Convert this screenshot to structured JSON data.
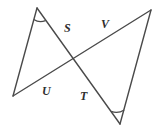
{
  "figure": {
    "canvas": {
      "width": 159,
      "height": 132
    },
    "background_color": "#ffffff",
    "stroke_color": "#4a4a4a",
    "label_color": "#2e2e2e",
    "vertices": {
      "top_left_apex": {
        "x": 37,
        "y": 8
      },
      "left_vertex": {
        "x": 13,
        "y": 96
      },
      "right_apex": {
        "x": 151,
        "y": 10
      },
      "bottom_right_vertex": {
        "x": 120,
        "y": 124
      },
      "crossing_point": {
        "x": 75,
        "y": 60
      }
    },
    "segments": [
      {
        "name": "apex-to-left-vertex",
        "from": "top_left_apex",
        "to": "left_vertex"
      },
      {
        "name": "apex-to-bottom-right-vertex",
        "from": "top_left_apex",
        "to": "bottom_right_vertex"
      },
      {
        "name": "left-vertex-to-right-apex",
        "from": "left_vertex",
        "to": "right_apex"
      },
      {
        "name": "right-apex-to-bottom-right-vertex",
        "from": "right_apex",
        "to": "bottom_right_vertex"
      }
    ],
    "angle_marks": [
      {
        "name": "arc-at-top-left-apex",
        "at": "top_left_apex"
      },
      {
        "name": "arc-at-bottom-right-vertex",
        "at": "bottom_right_vertex"
      }
    ],
    "labels": [
      {
        "id": "S",
        "text": "S",
        "x": 64,
        "y": 22,
        "description": "angle S, upper middle left"
      },
      {
        "id": "V",
        "text": "V",
        "x": 101,
        "y": 18,
        "description": "angle V, upper middle right"
      },
      {
        "id": "U",
        "text": "U",
        "x": 42,
        "y": 85,
        "description": "angle U, lower middle left"
      },
      {
        "id": "T",
        "text": "T",
        "x": 80,
        "y": 90,
        "description": "angle T, lower middle right"
      }
    ]
  }
}
